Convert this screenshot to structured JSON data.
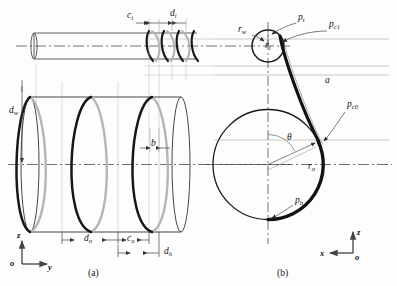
{
  "figure": {
    "panels": [
      {
        "id": "a",
        "caption": "(a)",
        "description": "side view of wire wound cylinder"
      },
      {
        "id": "b",
        "caption": "(b)",
        "description": "cross section view of winding"
      }
    ]
  },
  "panel_a": {
    "labels": {
      "c_i": {
        "base": "c",
        "sub": "i"
      },
      "d_i": {
        "base": "d",
        "sub": "i"
      },
      "d_w": {
        "base": "d",
        "sub": "w"
      },
      "b": {
        "base": "b",
        "sub": ""
      },
      "d_o": {
        "base": "d",
        "sub": "o"
      },
      "c_o": {
        "base": "c",
        "sub": "o"
      },
      "d_h": {
        "base": "d",
        "sub": "h"
      }
    },
    "axes": {
      "vertical": "z",
      "origin": "o",
      "horizontal": "y"
    }
  },
  "panel_b": {
    "labels": {
      "r_w": {
        "base": "r",
        "sub": "w"
      },
      "r_i": {
        "base": "r",
        "sub": "i"
      },
      "p_t": {
        "base": "p",
        "sub": "t"
      },
      "p_c1": {
        "base": "p",
        "sub": "c1"
      },
      "p_c0": {
        "base": "p",
        "sub": "c0"
      },
      "a": {
        "base": "a",
        "sub": ""
      },
      "theta": {
        "base": "θ",
        "sub": ""
      },
      "r_o": {
        "base": "r",
        "sub": "o"
      },
      "p_b": {
        "base": "p",
        "sub": "b"
      }
    },
    "axes": {
      "vertical": "z",
      "origin": "o",
      "horizontal": "x"
    }
  },
  "colors": {
    "stroke_dark": "#1d1d1d",
    "stroke_light": "#9a9a9a",
    "stroke_thin": "#8d8d8d",
    "centerline": "#333333",
    "background": "#fdfdfd"
  }
}
